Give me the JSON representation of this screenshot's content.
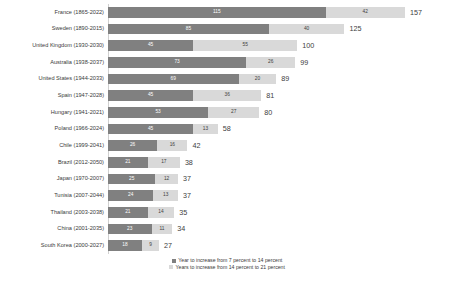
{
  "chart_data": {
    "type": "bar",
    "orientation": "horizontal",
    "stacked": true,
    "title": "",
    "xlabel": "",
    "ylabel": "",
    "grid": false,
    "legend_position": "bottom",
    "categories": [
      "France (1865-2022)",
      "Sweden (1890-2015)",
      "United Kingdom (1930-2030)",
      "Australia (1938-2037)",
      "United States (1944-2033)",
      "Spain (1947-2028)",
      "Hungary (1941-2021)",
      "Poland (1966-2024)",
      "Chile (1999-2041)",
      "Brazil (2012-2050)",
      "Japan (1970-2007)",
      "Tunisia (2007-2044)",
      "Thailand (2003-2038)",
      "China (2001-2035)",
      "South Korea (2000-2027)"
    ],
    "series": [
      {
        "name": "Year to increase from 7 percent to 14 percent",
        "color": "#808080",
        "values": [
          115,
          85,
          45,
          73,
          69,
          45,
          53,
          45,
          26,
          21,
          25,
          24,
          21,
          23,
          18
        ]
      },
      {
        "name": "Years to increase from 14 percent to 21 percent",
        "color": "#d9d9d9",
        "values": [
          42,
          40,
          55,
          26,
          20,
          36,
          27,
          13,
          16,
          17,
          12,
          13,
          14,
          11,
          9
        ]
      }
    ],
    "totals": [
      157,
      125,
      100,
      99,
      89,
      81,
      80,
      58,
      42,
      38,
      37,
      37,
      35,
      34,
      27
    ],
    "xlim": [
      0,
      157
    ]
  },
  "legend": {
    "items": [
      {
        "label": "Year to increase from 7 percent to 14 percent",
        "color": "#808080"
      },
      {
        "label": "Years to increase from 14 percent to 21 percent",
        "color": "#d9d9d9"
      }
    ]
  }
}
